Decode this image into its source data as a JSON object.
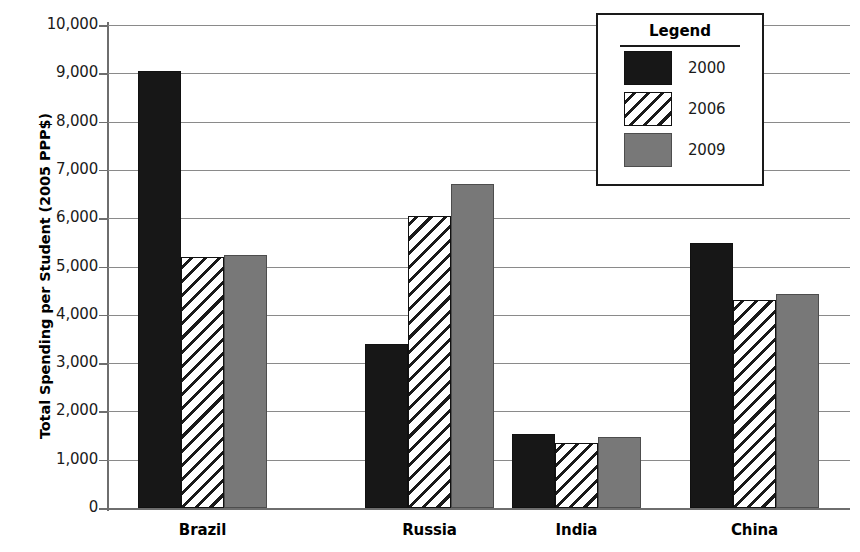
{
  "chart_data": {
    "type": "bar",
    "title": "",
    "xlabel": "",
    "ylabel": "Total Spending per Student (2005 PPP$)",
    "categories": [
      "Brazil",
      "Russia",
      "India",
      "China"
    ],
    "series": [
      {
        "name": "2000",
        "values": [
          9050,
          3400,
          1530,
          5480
        ]
      },
      {
        "name": "2006",
        "values": [
          5200,
          6050,
          1350,
          4300
        ]
      },
      {
        "name": "2009",
        "values": [
          5230,
          6700,
          1470,
          4430
        ]
      }
    ],
    "ylim": [
      0,
      10000
    ],
    "y_tick_labels": [
      "10,000",
      "9,000",
      "8,000",
      "7,000",
      "6,000",
      "5,000",
      "4,000",
      "3,000",
      "2,000",
      "1,000",
      "0"
    ],
    "y_tick_values": [
      10000,
      9000,
      8000,
      7000,
      6000,
      5000,
      4000,
      3000,
      2000,
      1000,
      0
    ],
    "grid": true,
    "legend_position": "top-right"
  },
  "legend": {
    "title": "Legend",
    "entries": [
      {
        "label": "2000",
        "swatch": "solid-black-swatch",
        "color": "#171717"
      },
      {
        "label": "2006",
        "swatch": "diagonal-hatch-swatch",
        "color": "#ffffff"
      },
      {
        "label": "2009",
        "swatch": "solid-gray-swatch",
        "color": "#787878"
      }
    ]
  },
  "colors": {
    "series_2000": "#171717",
    "series_2006": "#ffffff",
    "series_2009": "#787878",
    "gridline": "#8a8a8a",
    "axis": "#6e6e6e",
    "text": "#000000"
  }
}
